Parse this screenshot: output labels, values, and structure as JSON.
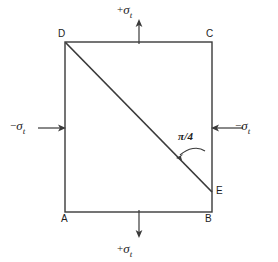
{
  "figure": {
    "background_color": "#ffffff",
    "line_color": "#3a3a3a",
    "text_color": "#1c1c1c"
  },
  "vertices": {
    "A": "A",
    "B": "B",
    "C": "C",
    "D": "D",
    "E": "E"
  },
  "stress_labels": {
    "top": {
      "sign": "+",
      "symbol": "σ",
      "subscript": "t"
    },
    "bottom": {
      "sign": "+",
      "symbol": "σ",
      "subscript": "t"
    },
    "left": {
      "sign": "−",
      "symbol": "σ",
      "subscript": "t"
    },
    "right": {
      "sign": "−",
      "symbol": "σ",
      "subscript": "t"
    }
  },
  "angle_label": "π/4",
  "geometry": {
    "square": {
      "left": 65,
      "top": 42,
      "right": 212,
      "bottom": 212
    },
    "diagonal": {
      "from": "D",
      "to": "E",
      "x1": 65,
      "y1": 42,
      "x2": 212,
      "y2": 192
    },
    "arrows": {
      "top": {
        "direction": "up",
        "x": 139,
        "from_y": 42,
        "to_y": 22
      },
      "bottom": {
        "direction": "down",
        "x": 139,
        "from_y": 212,
        "to_y": 234
      },
      "left": {
        "direction": "right",
        "y": 128,
        "from_x": 38,
        "to_x": 65
      },
      "right": {
        "direction": "left",
        "y": 128,
        "from_x": 243,
        "to_x": 212
      }
    }
  }
}
